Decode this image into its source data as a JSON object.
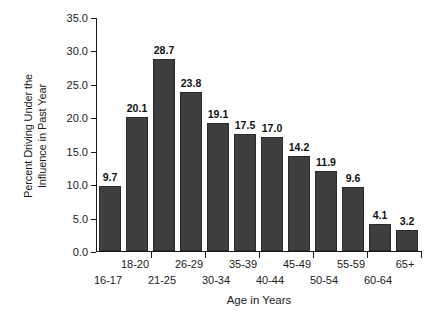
{
  "chart_data": {
    "type": "bar",
    "title": "",
    "xlabel": "Age in Years",
    "ylabel": "Percent Driving Under the Influence in Past Year",
    "ylabel_lines": [
      "Percent Driving Under the",
      "Influence in Past Year"
    ],
    "categories": [
      "16-17",
      "18-20",
      "21-25",
      "26-29",
      "30-34",
      "35-39",
      "40-44",
      "45-49",
      "50-54",
      "55-59",
      "60-64",
      "65+"
    ],
    "values": [
      9.7,
      20.1,
      28.7,
      23.8,
      19.1,
      17.5,
      17.0,
      14.2,
      11.9,
      9.6,
      4.1,
      3.2
    ],
    "value_labels": [
      "9.7",
      "20.1",
      "28.7",
      "23.8",
      "19.1",
      "17.5",
      "17.0",
      "14.2",
      "11.9",
      "9.6",
      "4.1",
      "3.2"
    ],
    "ylim": [
      0,
      35
    ],
    "ytick_values": [
      0,
      5,
      10,
      15,
      20,
      25,
      30,
      35
    ],
    "ytick_labels": [
      "0.0",
      "5.0",
      "10.0",
      "15.0",
      "20.0",
      "25.0",
      "30.0",
      "35.0"
    ],
    "grid": false,
    "legend": false,
    "bar_color": "#3f3f3f",
    "axis_color": "#1a1a1a",
    "background_color": "#ffffff"
  }
}
